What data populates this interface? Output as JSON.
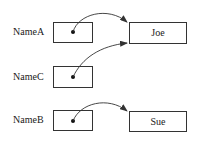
{
  "diagram": {
    "type": "pointer-reference",
    "variables": [
      {
        "name": "NameA",
        "points_to": "Joe"
      },
      {
        "name": "NameC",
        "points_to": "Joe"
      },
      {
        "name": "NameB",
        "points_to": "Sue"
      }
    ],
    "objects": [
      {
        "value": "Joe"
      },
      {
        "value": "Sue"
      }
    ],
    "colors": {
      "stroke": "#333333",
      "text": "#1a1a1a",
      "background": "#ffffff"
    }
  }
}
